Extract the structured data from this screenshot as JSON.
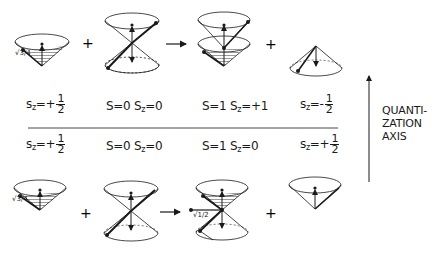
{
  "diagram": {
    "type": "spin-coupling vector model",
    "operators": {
      "plus": "+",
      "arrow": "→"
    },
    "top_row": {
      "labels": [
        {
          "pre": "s",
          "sub": "z",
          "eq": "=+",
          "num": "1",
          "den": "2"
        },
        {
          "text": "S=0 S",
          "sub": "z",
          "eq": "=0"
        },
        {
          "text": "S=1 S",
          "sub": "z",
          "eq": "=+1"
        },
        {
          "pre": "s",
          "sub": "z",
          "eq": "=-",
          "num": "1",
          "den": "2"
        }
      ],
      "annotations": {
        "sqrt_3_4": "√3/4"
      }
    },
    "bottom_row": {
      "labels": [
        {
          "pre": "s",
          "sub": "z",
          "eq": "=+",
          "num": "1",
          "den": "2"
        },
        {
          "text": "S=0 S",
          "sub": "z",
          "eq": "=0"
        },
        {
          "text": "S=1 S",
          "sub": "z",
          "eq": "=0"
        },
        {
          "pre": "s",
          "sub": "z",
          "eq": "=+",
          "num": "1",
          "den": "2"
        }
      ],
      "annotations": {
        "sqrt_3_4": "√3/4",
        "sqrt_1_2": "√1/2",
        "sqrt_3_4_b": "√3/4"
      }
    },
    "axis": {
      "line1": "QUANTI-",
      "line2": "ZATION",
      "line3": "AXIS"
    },
    "colors": {
      "ink": "#1a1a1a",
      "background": "#ffffff"
    }
  }
}
